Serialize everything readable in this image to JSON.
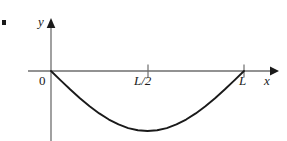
{
  "figure": {
    "name": "sine-half-wave-below-axis",
    "background_color": "#ffffff",
    "axis_color": "#6e6e6e",
    "curve_color": "#1a1a1a",
    "tick_color": "#6e6e6e",
    "label_color": "#1a1a1a",
    "marker_dot": "bullet-marker"
  },
  "labels": {
    "y_axis": "y",
    "x_axis": "x",
    "origin": "0",
    "tick_half": "L/2",
    "tick_full": "L"
  },
  "chart_data": {
    "type": "line",
    "title": "",
    "subtitle": "",
    "xlabel": "x",
    "ylabel": "y",
    "grid": false,
    "legend": null,
    "annotations": [],
    "xlim": [
      0,
      1.18
    ],
    "ylim": [
      -1.15,
      0.55
    ],
    "xticks": [
      0,
      0.5,
      1
    ],
    "xticklabels": [
      "0",
      "L/2",
      "L"
    ],
    "yticks": [],
    "yticklabels": [],
    "series": [
      {
        "name": "y = -A sin(pi x / L)",
        "color": "#1a1a1a",
        "x": [
          0,
          0.05,
          0.1,
          0.15,
          0.2,
          0.25,
          0.3,
          0.35,
          0.4,
          0.45,
          0.5,
          0.55,
          0.6,
          0.65,
          0.7,
          0.75,
          0.8,
          0.85,
          0.9,
          0.95,
          1
        ],
        "values": [
          0,
          -0.156,
          -0.309,
          -0.454,
          -0.588,
          -0.707,
          -0.809,
          -0.891,
          -0.951,
          -0.988,
          -1,
          -0.988,
          -0.951,
          -0.891,
          -0.809,
          -0.707,
          -0.588,
          -0.454,
          -0.309,
          -0.156,
          0
        ]
      }
    ]
  }
}
